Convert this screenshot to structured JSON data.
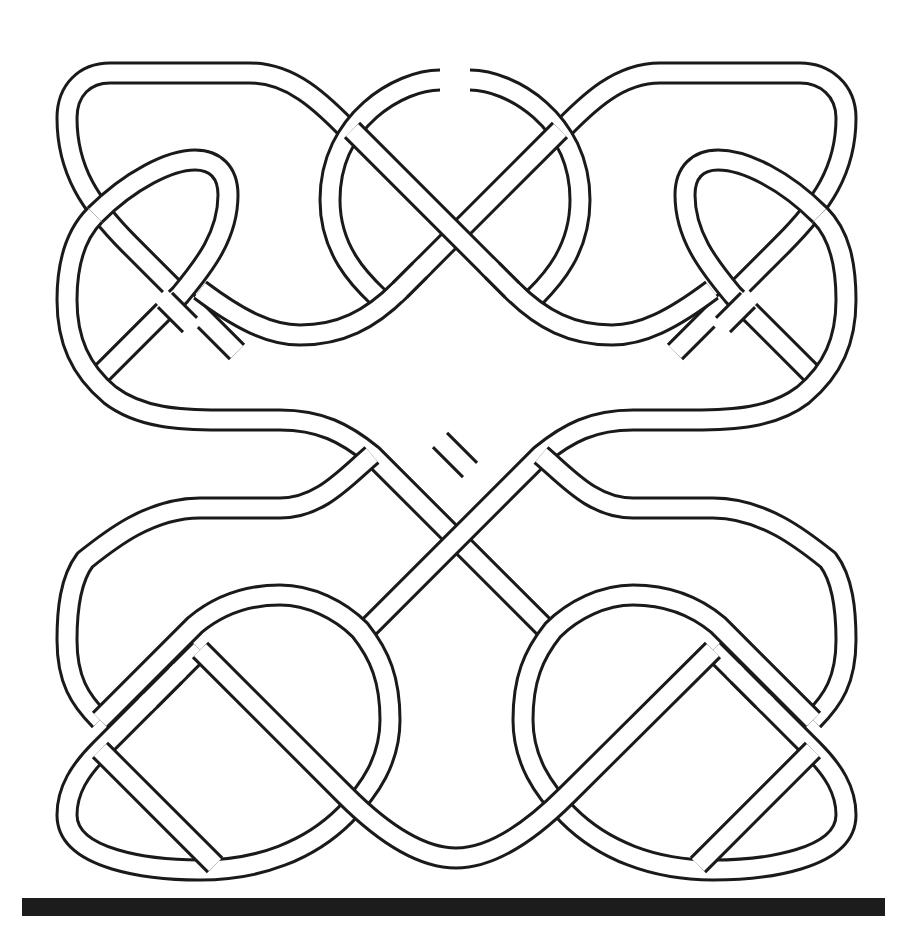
{
  "image": {
    "title": "Celtic knot square pattern",
    "description": "Black-outlined interlaced knotwork band on white background with a thick black rule beneath",
    "colors": {
      "background": "#ffffff",
      "outline": "#1a1a1a",
      "band_fill": "#ffffff",
      "bar": "#1c1c1c"
    },
    "knot": {
      "bounds": {
        "left": 57,
        "top": 62,
        "right": 857,
        "bottom": 880
      },
      "band_width": 20,
      "outline_width": 3,
      "grid": "4x4 interlace with corner loops"
    },
    "bar": {
      "left": 22,
      "top": 898,
      "width": 863,
      "height": 18
    }
  }
}
